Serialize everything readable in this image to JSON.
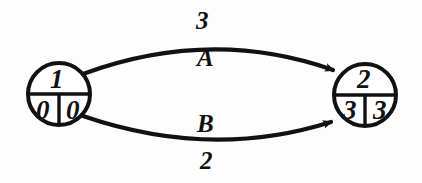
{
  "diagram": {
    "type": "activity-on-arrow-network",
    "background_color": "#fdfdfd",
    "stroke_color": "#111111",
    "nodes": [
      {
        "name": "node-1",
        "id_label": "1",
        "early_label": "0",
        "late_label": "0",
        "cx": 59,
        "cy": 94,
        "r": 31
      },
      {
        "name": "node-2",
        "id_label": "2",
        "early_label": "3",
        "late_label": "3",
        "cx": 365,
        "cy": 95,
        "r": 31
      }
    ],
    "edges": [
      {
        "name": "edge-a",
        "label": "A",
        "duration": "3",
        "from": "1",
        "to": "2",
        "curve": "upper"
      },
      {
        "name": "edge-b",
        "label": "B",
        "duration": "2",
        "from": "1",
        "to": "2",
        "curve": "lower"
      }
    ]
  }
}
